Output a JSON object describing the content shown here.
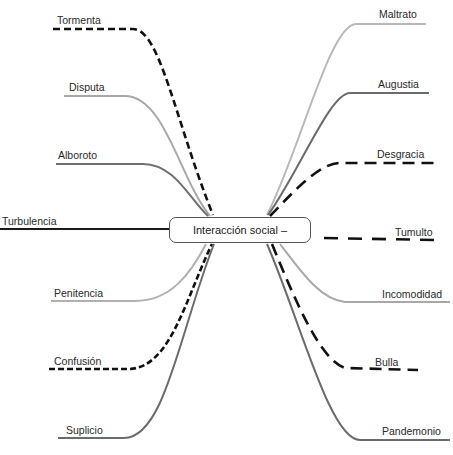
{
  "center": {
    "label": "Interacción social –"
  },
  "colors": {
    "dark": "#1a1a1a",
    "mid": "#6b6b6b",
    "light": "#b5b5b5",
    "dashed": "#111111"
  },
  "branches": {
    "left": [
      {
        "label": "Tormenta",
        "style": "dashed-short"
      },
      {
        "label": "Disputa",
        "style": "light"
      },
      {
        "label": "Alboroto",
        "style": "mid"
      },
      {
        "label": "Turbulencia",
        "style": "dark"
      },
      {
        "label": "Penitencia",
        "style": "light"
      },
      {
        "label": "Confusión",
        "style": "dashed-short"
      },
      {
        "label": "Suplicio",
        "style": "mid"
      }
    ],
    "right": [
      {
        "label": "Maltrato",
        "style": "light"
      },
      {
        "label": "Augustia",
        "style": "mid"
      },
      {
        "label": "Desgracia",
        "style": "dashed-long"
      },
      {
        "label": "Tumulto",
        "style": "dashed-long"
      },
      {
        "label": "Incomodidad",
        "style": "light"
      },
      {
        "label": "Bulla",
        "style": "dashed-long"
      },
      {
        "label": "Pandemonio",
        "style": "mid"
      }
    ]
  }
}
